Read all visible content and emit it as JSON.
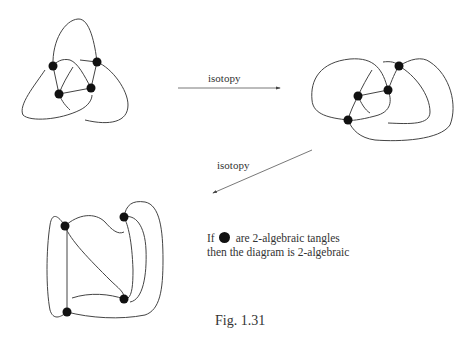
{
  "figure": {
    "caption": "Fig. 1.31",
    "arrows": [
      {
        "label": "isotopy",
        "direction": "right"
      },
      {
        "label": "isotopy",
        "direction": "down-left"
      }
    ],
    "note": {
      "line1_prefix": "If",
      "line1_suffix": "are 2-algebraic tangles",
      "line2": "then the diagram is 2-algebraic"
    },
    "diagrams": [
      {
        "name": "trefoil-like diagram",
        "tangle_count": 4
      },
      {
        "name": "isotoped diagram",
        "tangle_count": 4
      },
      {
        "name": "rectangular diagram",
        "tangle_count": 4
      }
    ],
    "colors": {
      "stroke": "#333333",
      "tangle": "#111111"
    }
  }
}
